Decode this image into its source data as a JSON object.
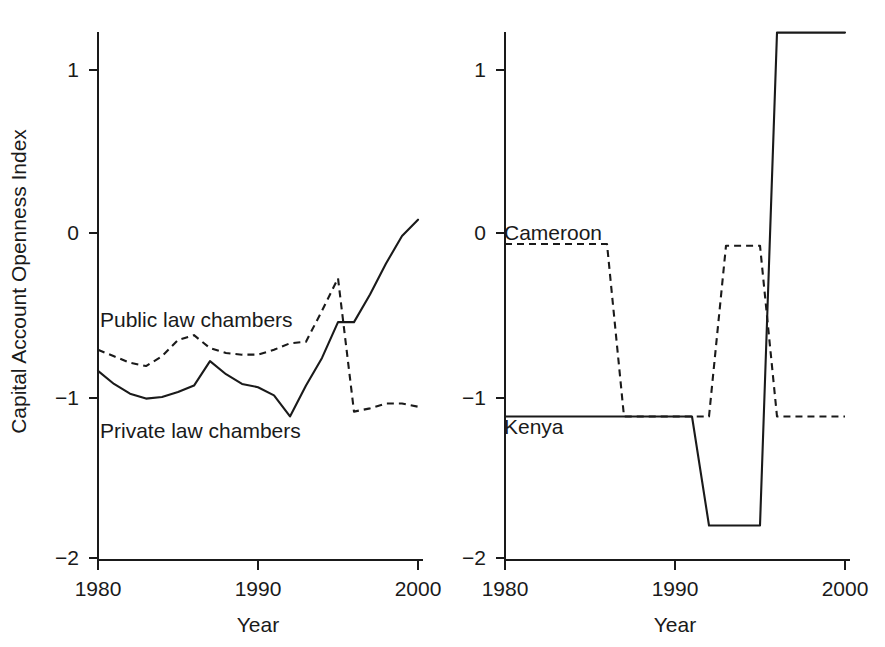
{
  "figure": {
    "background": "#ffffff",
    "ink_color": "#1a1a1a"
  },
  "chart_data": [
    {
      "panel": "left",
      "type": "line",
      "title": "",
      "xlabel": "Year",
      "ylabel": "Capital Account Openness Index",
      "xlim": [
        1980,
        2000
      ],
      "ylim": [
        -2,
        1.35
      ],
      "xticks": [
        1980,
        1990,
        2000
      ],
      "xticklabels": [
        "1980",
        "1990",
        "2000"
      ],
      "yticks": [
        1,
        0,
        -1,
        -2
      ],
      "yticklabels": [
        "1",
        "0",
        "-1",
        "-2"
      ],
      "grid": false,
      "legend_position": "inline-annotations",
      "x": [
        1980,
        1981,
        1982,
        1983,
        1984,
        1985,
        1986,
        1987,
        1988,
        1989,
        1990,
        1991,
        1992,
        1993,
        1994,
        1995,
        1996,
        1997,
        1998,
        1999,
        2000
      ],
      "series": [
        {
          "name": "Public law chambers",
          "style": "dashed",
          "annotation": "Public law chambers",
          "values": [
            -0.72,
            -0.76,
            -0.8,
            -0.82,
            -0.76,
            -0.66,
            -0.63,
            -0.71,
            -0.74,
            -0.75,
            -0.75,
            -0.72,
            -0.68,
            -0.67,
            -0.48,
            -0.28,
            -1.1,
            -1.08,
            -1.05,
            -1.05,
            -1.07
          ]
        },
        {
          "name": "Private law chambers",
          "style": "solid",
          "annotation": "Private law chambers",
          "values": [
            -0.85,
            -0.93,
            -0.99,
            -1.02,
            -1.01,
            -0.98,
            -0.94,
            -0.79,
            -0.87,
            -0.93,
            -0.95,
            -1.0,
            -1.13,
            -0.94,
            -0.77,
            -0.55,
            -0.55,
            -0.38,
            -0.19,
            -0.02,
            0.08
          ]
        }
      ]
    },
    {
      "panel": "right",
      "type": "line",
      "title": "",
      "xlabel": "Year",
      "ylabel": "",
      "xlim": [
        1980,
        2000
      ],
      "ylim": [
        -2,
        1.35
      ],
      "xticks": [
        1980,
        1990,
        2000
      ],
      "xticklabels": [
        "1980",
        "1990",
        "2000"
      ],
      "yticks": [
        1,
        0,
        -1,
        -2
      ],
      "yticklabels": [
        "1",
        "0",
        "-1",
        "-2"
      ],
      "grid": false,
      "legend_position": "inline-annotations",
      "x": [
        1980,
        1981,
        1982,
        1983,
        1984,
        1985,
        1986,
        1987,
        1988,
        1989,
        1990,
        1991,
        1992,
        1993,
        1994,
        1995,
        1996,
        1997,
        1998,
        1999,
        2000
      ],
      "series": [
        {
          "name": "Cameroon",
          "style": "dashed",
          "annotation": "Cameroon",
          "values": [
            -0.07,
            -0.07,
            -0.07,
            -0.07,
            -0.07,
            -0.07,
            -0.07,
            -1.13,
            -1.13,
            -1.13,
            -1.13,
            -1.13,
            -1.13,
            -0.08,
            -0.08,
            -0.08,
            -1.13,
            -1.13,
            -1.13,
            -1.13,
            -1.13
          ]
        },
        {
          "name": "Kenya",
          "style": "solid",
          "annotation": "Kenya",
          "values": [
            -1.13,
            -1.13,
            -1.13,
            -1.13,
            -1.13,
            -1.13,
            -1.13,
            -1.13,
            -1.13,
            -1.13,
            -1.13,
            -1.13,
            -1.8,
            -1.8,
            -1.8,
            -1.8,
            1.23,
            1.23,
            1.23,
            1.23,
            1.23
          ]
        }
      ]
    }
  ]
}
